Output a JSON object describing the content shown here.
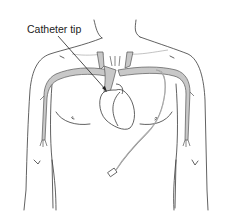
{
  "diagram": {
    "labels": {
      "catheter_tip": "Catheter tip"
    },
    "colors": {
      "outline": "#3a3a3a",
      "vein_fill": "#c8c8c8",
      "vein_stroke": "#555555",
      "catheter": "#7a7a7a",
      "background": "#ffffff"
    },
    "elements": [
      "torso-outline",
      "neck",
      "arms",
      "veins",
      "heart",
      "catheter-line",
      "catheter-hub",
      "nipples",
      "arrow-to-tip"
    ]
  }
}
